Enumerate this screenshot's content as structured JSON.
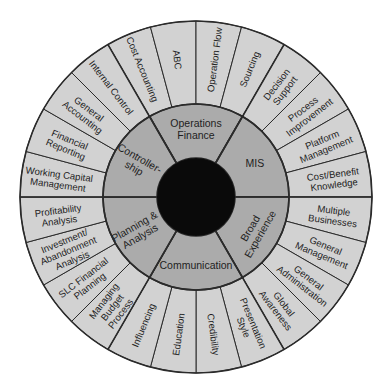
{
  "diagram": {
    "type": "competency-wheel",
    "center_label": "",
    "colors": {
      "outer_ring": "#d2d2d2",
      "middle_ring": "#ababab",
      "core": "#0a0a0a",
      "lines": "#2b2b2b",
      "text": "#1e1e1e"
    },
    "categories": [
      {
        "name": "Operations Finance",
        "lines": [
          "Operations",
          "Finance"
        ],
        "orient": "flat",
        "skills": [
          {
            "name": "Cost Accounting",
            "lines": [
              "Cost Accounting"
            ]
          },
          {
            "name": "ABC",
            "lines": [
              "ABC"
            ]
          },
          {
            "name": "Operation Flow",
            "lines": [
              "Operation Flow"
            ]
          },
          {
            "name": "Sourcing",
            "lines": [
              "Sourcing"
            ]
          }
        ]
      },
      {
        "name": "MIS",
        "lines": [
          "MIS"
        ],
        "orient": "flat",
        "skills": [
          {
            "name": "Decision Support",
            "lines": [
              "Decision",
              "Support"
            ]
          },
          {
            "name": "Process Improvement",
            "lines": [
              "Process",
              "Improvement"
            ]
          },
          {
            "name": "Platform Management",
            "lines": [
              "Platform",
              "Management"
            ]
          },
          {
            "name": "Cost/Benefit Knowledge",
            "lines": [
              "Cost/Benefit",
              "Knowledge"
            ]
          }
        ]
      },
      {
        "name": "Broad Experience",
        "lines": [
          "Broad",
          "Experience"
        ],
        "orient": "radial",
        "skills": [
          {
            "name": "Multiple Businesses",
            "lines": [
              "Multiple",
              "Businesses"
            ]
          },
          {
            "name": "General Management",
            "lines": [
              "General",
              "Management"
            ]
          },
          {
            "name": "General Administration",
            "lines": [
              "General",
              "Administration"
            ]
          },
          {
            "name": "Global Awareness",
            "lines": [
              "Global",
              "Awareness"
            ]
          }
        ]
      },
      {
        "name": "Communication",
        "lines": [
          "Communication"
        ],
        "orient": "flat",
        "skills": [
          {
            "name": "Presentation Style",
            "lines": [
              "Presentation",
              "Style"
            ]
          },
          {
            "name": "Credibility",
            "lines": [
              "Credibility"
            ]
          },
          {
            "name": "Education",
            "lines": [
              "Education"
            ]
          },
          {
            "name": "Influencing",
            "lines": [
              "Influencing"
            ]
          }
        ]
      },
      {
        "name": "Planning & Analysis",
        "lines": [
          "Planning &",
          "Analysis"
        ],
        "orient": "radial",
        "skills": [
          {
            "name": "Managing Budget Process",
            "lines": [
              "Managing",
              "Budget",
              "Process"
            ]
          },
          {
            "name": "SLC Financial Planning",
            "lines": [
              "SLC Financial",
              "Planning"
            ]
          },
          {
            "name": "Investment/Abandonment Analysis",
            "lines": [
              "Investment/",
              "Abandonment",
              "Analysis"
            ]
          },
          {
            "name": "Profitability Analysis",
            "lines": [
              "Profitability",
              "Analysis"
            ]
          }
        ]
      },
      {
        "name": "Controllership",
        "lines": [
          "Controller-",
          "ship"
        ],
        "orient": "radial",
        "skills": [
          {
            "name": "Working Capital Management",
            "lines": [
              "Working Capital",
              "Management"
            ]
          },
          {
            "name": "Financial Reporting",
            "lines": [
              "Financial",
              "Reporting"
            ]
          },
          {
            "name": "General Accounting",
            "lines": [
              "General",
              "Accounting"
            ]
          },
          {
            "name": "Internal Control",
            "lines": [
              "Internal Control"
            ]
          }
        ]
      }
    ]
  }
}
